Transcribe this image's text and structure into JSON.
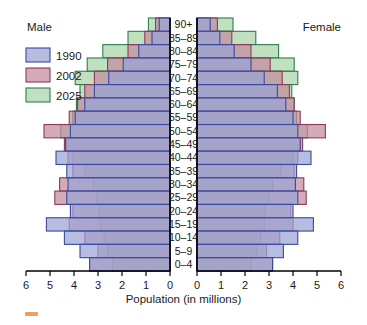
{
  "chart_data": {
    "type": "bar",
    "chart_variant": "population-pyramid",
    "title": "",
    "xlabel": "Population (in millions)",
    "ylabel": "",
    "grid": true,
    "legend_position": "top-left",
    "xlim": [
      0,
      6
    ],
    "x_ticks": [
      0,
      1,
      2,
      3,
      4,
      5,
      6
    ],
    "left_tick_labels": [
      "6",
      "5",
      "4",
      "3",
      "2",
      "1",
      "0"
    ],
    "right_tick_labels": [
      "0",
      "1",
      "2",
      "3",
      "4",
      "5",
      "6"
    ],
    "side_labels": {
      "left": "Male",
      "right": "Female"
    },
    "categories": [
      "90+",
      "85–89",
      "80–84",
      "75–79",
      "70–74",
      "65–69",
      "60–64",
      "55–59",
      "50–54",
      "45–49",
      "40–44",
      "35–39",
      "30–34",
      "25–29",
      "20–24",
      "15–19",
      "10–14",
      "5–9",
      "0–4"
    ],
    "legend": [
      {
        "name": "1990",
        "color": "#9aa3d4"
      },
      {
        "name": "2002",
        "color": "#c28b9e"
      },
      {
        "name": "2025",
        "color": "#a8d4a8"
      }
    ],
    "series": [
      {
        "name": "1990",
        "color": "#9aa3d4",
        "edge": "#3a4a9e",
        "male": [
          0.45,
          0.75,
          1.3,
          1.95,
          2.55,
          3.15,
          3.55,
          3.95,
          4.15,
          4.35,
          4.75,
          4.3,
          4.25,
          4.3,
          4.15,
          5.15,
          4.4,
          3.75,
          3.35
        ],
        "female": [
          0.55,
          0.95,
          1.55,
          2.25,
          2.8,
          3.35,
          3.7,
          4.0,
          4.2,
          4.3,
          4.75,
          4.15,
          4.1,
          4.2,
          4.0,
          4.85,
          4.2,
          3.6,
          3.15
        ]
      },
      {
        "name": "2002",
        "color": "#c28b9e",
        "edge": "#8e3a5a",
        "male": [
          0.6,
          1.05,
          1.75,
          2.6,
          3.15,
          3.55,
          3.85,
          4.2,
          5.25,
          4.4,
          4.25,
          4.05,
          4.6,
          4.8,
          4.05,
          4.2,
          3.55,
          3.0,
          3.35
        ],
        "female": [
          0.85,
          1.45,
          2.25,
          3.05,
          3.55,
          3.85,
          4.05,
          4.3,
          5.35,
          4.4,
          4.2,
          4.05,
          4.45,
          4.55,
          3.9,
          4.0,
          3.45,
          2.9,
          3.15
        ]
      },
      {
        "name": "2025",
        "color": "#a8d4a8",
        "edge": "#2e7d4f",
        "male": [
          0.9,
          1.75,
          2.8,
          3.45,
          3.95,
          3.75,
          3.9,
          4.05,
          4.55,
          4.3,
          4.05,
          3.55,
          3.2,
          3.05,
          2.95,
          2.9,
          2.75,
          2.6,
          2.4
        ],
        "female": [
          1.5,
          2.45,
          3.4,
          4.05,
          4.2,
          3.95,
          4.05,
          4.15,
          4.6,
          4.3,
          4.0,
          3.5,
          3.15,
          3.0,
          2.85,
          2.8,
          2.65,
          2.5,
          2.25
        ]
      }
    ]
  },
  "axis": {
    "title": "Population (in millions)"
  },
  "labels": {
    "male": "Male",
    "female": "Female"
  },
  "colors": {
    "series_1990_fill": "#9aa3d4",
    "series_1990_edge": "#3a4a9e",
    "series_2002_fill": "#c28b9e",
    "series_2002_edge": "#8e3a5a",
    "series_2025_fill": "#a8d4a8",
    "series_2025_edge": "#2e7d4f",
    "axis": "#000000",
    "background": "#ffffff"
  },
  "footer_mark": {
    "label": "orange-marker",
    "color": "#e8a06a"
  }
}
